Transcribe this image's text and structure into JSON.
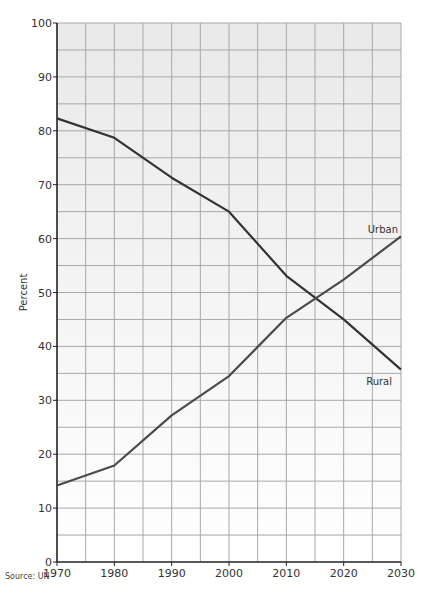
{
  "chart_data": {
    "type": "line",
    "title": "",
    "xlabel": "",
    "ylabel": "Percent",
    "x": [
      1970,
      1980,
      1990,
      2000,
      2010,
      2020,
      2030
    ],
    "series": [
      {
        "name": "Rural",
        "values": [
          82.3,
          78.7,
          71.3,
          65.0,
          53.1,
          45.0,
          35.7
        ],
        "color": "#333333"
      },
      {
        "name": "Urban",
        "values": [
          14.2,
          17.9,
          27.2,
          34.5,
          45.3,
          52.4,
          60.4
        ],
        "color": "#4a4a4a"
      }
    ],
    "xlim": [
      1970,
      2030
    ],
    "ylim": [
      0,
      100
    ],
    "x_ticks": [
      1970,
      1980,
      1990,
      2000,
      2010,
      2020,
      2030
    ],
    "y_ticks": [
      0,
      10,
      20,
      30,
      40,
      50,
      60,
      70,
      80,
      90,
      100
    ],
    "grid": true,
    "grid_minor_step_x": 5,
    "grid_minor_step_y": 5,
    "legend": "inline labels at line ends",
    "annotations": [
      "Urban",
      "Rural"
    ],
    "source": "Source: UN",
    "colors": {
      "background_top": "#e9e9e9",
      "background_bottom": "#ffffff",
      "grid": "#a8a8a8",
      "axis": "#222222"
    }
  }
}
